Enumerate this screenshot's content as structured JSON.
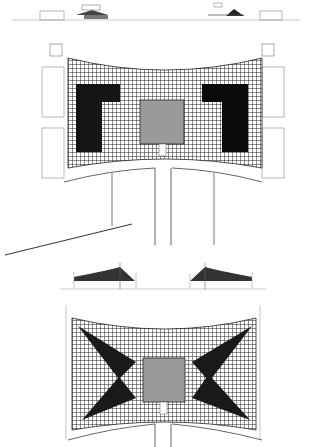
{
  "drawing": {
    "type": "architectural plan and elevation sheet",
    "views": [
      {
        "name": "top-elevation",
        "label": ""
      },
      {
        "name": "upper-plan",
        "label": ""
      },
      {
        "name": "lower-elevation",
        "label": ""
      },
      {
        "name": "lower-plan",
        "label": ""
      }
    ]
  },
  "colors": {
    "grid_line": "#222222",
    "solid_fill": "#111111",
    "center_square": "#9a9a9a",
    "outline": "#666666",
    "background": "#ffffff"
  }
}
